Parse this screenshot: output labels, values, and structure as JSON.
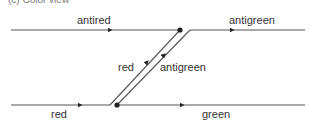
{
  "caption": "(c) Color view",
  "colors": {
    "line": "#555555",
    "text": "#333333",
    "dot": "#222222"
  },
  "labels": {
    "top_left": "antired",
    "top_right": "antigreen",
    "mid_left": "red",
    "mid_right": "antigreen",
    "bottom_left": "red",
    "bottom_right": "green"
  },
  "lines": [
    {
      "name": "antired-line",
      "x1": 11,
      "y1": 30,
      "x2": 180,
      "y2": 30,
      "arrow_at": [
        110,
        30
      ]
    },
    {
      "name": "antigreen-top-line",
      "x1": 190,
      "y1": 30,
      "x2": 305,
      "y2": 30,
      "arrow_at": [
        232,
        30
      ]
    },
    {
      "name": "red-bottom-line",
      "x1": 11,
      "y1": 105,
      "x2": 110,
      "y2": 105,
      "arrow_at": [
        80,
        105
      ]
    },
    {
      "name": "green-bottom-line",
      "x1": 117,
      "y1": 105,
      "x2": 305,
      "y2": 105,
      "arrow_at": [
        182,
        105
      ]
    },
    {
      "name": "red-diagonal",
      "x1": 110,
      "y1": 105,
      "x2": 180,
      "y2": 30,
      "arrow_at": [
        147,
        62
      ]
    },
    {
      "name": "antigreen-diagonal",
      "x1": 117,
      "y1": 105,
      "x2": 190,
      "y2": 30,
      "arrow_at": [
        164,
        55
      ]
    }
  ],
  "vertices": [
    {
      "name": "top-vertex",
      "x": 180,
      "y": 30
    },
    {
      "name": "bottom-vertex",
      "x": 117,
      "y": 105
    }
  ]
}
